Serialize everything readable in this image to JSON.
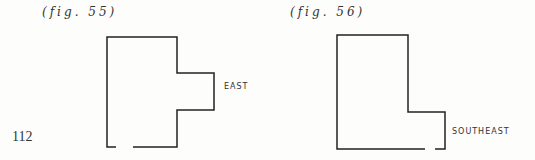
{
  "page_number": "112",
  "figures": [
    {
      "caption": "(fig. 55)",
      "direction_label": "EAST"
    },
    {
      "caption": "(fig. 56)",
      "direction_label": "SOUTHEAST"
    }
  ]
}
